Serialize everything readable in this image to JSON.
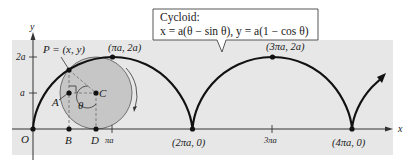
{
  "figure": {
    "title": "Cycloid",
    "callout": {
      "line1": "Cycloid:",
      "line2": "x = a(θ − sin θ), y = a(1 − cos θ)"
    },
    "axes": {
      "x_label": "x",
      "y_label": "y",
      "origin_label": "O",
      "y_ticks": [
        "a",
        "2a"
      ],
      "x_ticks": [
        "πa",
        "3πa"
      ]
    },
    "points": {
      "P": "P = (x, y)",
      "A": "A",
      "B": "B",
      "C": "C",
      "D": "D",
      "angle": "θ",
      "peak1": "(πa, 2a)",
      "peak2": "(3πa, 2a)",
      "cusp1": "(2πa, 0)",
      "cusp2": "(4πa, 0)"
    },
    "colors": {
      "background_panel": "#e6e6e6",
      "circle_fill": "#c4c4c4",
      "curve": "#111111",
      "dashed": "#888888"
    }
  }
}
